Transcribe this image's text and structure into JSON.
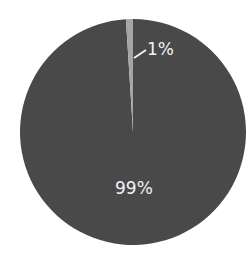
{
  "chart_data": {
    "type": "pie",
    "title": "",
    "categories": [
      "Small segment",
      "Large segment"
    ],
    "values": [
      1,
      99
    ],
    "labels": [
      "1%",
      "99%"
    ],
    "colors": [
      "#a9a9a9",
      "#4b4b4b"
    ],
    "start_angle_deg": -3.6,
    "legend": null
  },
  "labels": {
    "small": "1%",
    "large": "99%"
  }
}
